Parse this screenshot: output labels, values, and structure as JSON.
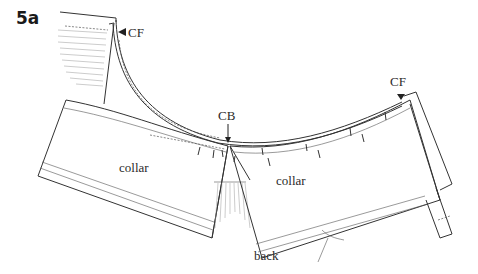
{
  "figure": {
    "label": "5a",
    "labels": {
      "cf_top": "CF",
      "cf_right": "CF",
      "cb": "CB",
      "collar_left": "collar",
      "collar_right": "collar",
      "back": "back"
    },
    "colors": {
      "line": "#333333",
      "background": "#ffffff"
    }
  }
}
